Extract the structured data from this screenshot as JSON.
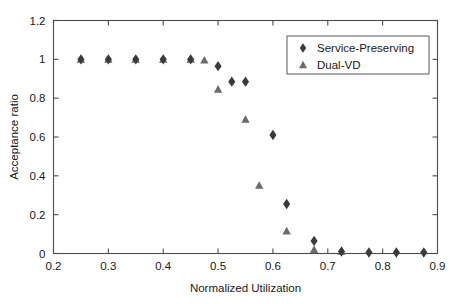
{
  "chart_data": {
    "type": "scatter",
    "title": "",
    "xlabel": "Normalized Utilization",
    "ylabel": "Acceptance ratio",
    "xlim": [
      0.2,
      0.9
    ],
    "ylim": [
      0,
      1.2
    ],
    "xticks": [
      "0.2",
      "0.3",
      "0.4",
      "0.5",
      "0.6",
      "0.7",
      "0.8",
      "0.9"
    ],
    "xtick_values": [
      0.2,
      0.3,
      0.4,
      0.5,
      0.6,
      0.7,
      0.8,
      0.9
    ],
    "yticks": [
      "0",
      "0.2",
      "0.4",
      "0.6",
      "0.8",
      "1",
      "1.2"
    ],
    "ytick_values": [
      0,
      0.2,
      0.4,
      0.6,
      0.8,
      1.0,
      1.2
    ],
    "grid": false,
    "legend_position": "top-right",
    "series": [
      {
        "name": "Service-Preserving",
        "marker": "diamond",
        "color": "#3a3a3a",
        "points": [
          {
            "x": 0.25,
            "y": 1.0
          },
          {
            "x": 0.3,
            "y": 1.0
          },
          {
            "x": 0.35,
            "y": 1.0
          },
          {
            "x": 0.4,
            "y": 1.0
          },
          {
            "x": 0.45,
            "y": 1.0
          },
          {
            "x": 0.5,
            "y": 0.965
          },
          {
            "x": 0.525,
            "y": 0.885
          },
          {
            "x": 0.55,
            "y": 0.885
          },
          {
            "x": 0.6,
            "y": 0.61
          },
          {
            "x": 0.625,
            "y": 0.255
          },
          {
            "x": 0.675,
            "y": 0.065
          },
          {
            "x": 0.725,
            "y": 0.01
          },
          {
            "x": 0.775,
            "y": 0.005
          },
          {
            "x": 0.825,
            "y": 0.005
          },
          {
            "x": 0.875,
            "y": 0.005
          }
        ]
      },
      {
        "name": "Dual-VD",
        "marker": "triangle",
        "color": "#6b6b6b",
        "points": [
          {
            "x": 0.25,
            "y": 1.0
          },
          {
            "x": 0.3,
            "y": 1.0
          },
          {
            "x": 0.35,
            "y": 1.0
          },
          {
            "x": 0.4,
            "y": 1.0
          },
          {
            "x": 0.45,
            "y": 1.0
          },
          {
            "x": 0.475,
            "y": 0.995
          },
          {
            "x": 0.5,
            "y": 0.845
          },
          {
            "x": 0.55,
            "y": 0.69
          },
          {
            "x": 0.575,
            "y": 0.35
          },
          {
            "x": 0.625,
            "y": 0.115
          },
          {
            "x": 0.675,
            "y": 0.02
          },
          {
            "x": 0.725,
            "y": 0.01
          }
        ]
      }
    ]
  },
  "legend": {
    "entries": [
      {
        "label": "Service-Preserving",
        "marker": "diamond"
      },
      {
        "label": "Dual-VD",
        "marker": "triangle"
      }
    ]
  }
}
